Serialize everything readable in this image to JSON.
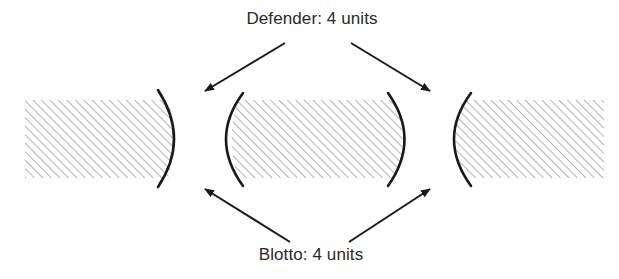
{
  "diagram": {
    "labels": {
      "defender": "Defender: 4 units",
      "blotto": "Blotto: 4 units"
    },
    "colors": {
      "background": "#ffffff",
      "ink": "#1a1a1a",
      "hatch": "#8a8a8a",
      "text": "#2a2a2a"
    },
    "regions": [
      {
        "name": "left-territory",
        "x": 25,
        "y": 100,
        "w": 150,
        "h": 78
      },
      {
        "name": "middle-territory",
        "x": 226,
        "y": 100,
        "w": 178,
        "h": 78
      },
      {
        "name": "right-territory",
        "x": 452,
        "y": 100,
        "w": 152,
        "h": 78
      }
    ],
    "fronts": [
      {
        "name": "front-1-left-edge",
        "side": "right"
      },
      {
        "name": "front-1-right-edge",
        "side": "left"
      },
      {
        "name": "front-2-left-edge",
        "side": "right"
      },
      {
        "name": "front-2-right-edge",
        "side": "left"
      }
    ],
    "arrows": [
      {
        "name": "defender-arrow-front-1",
        "from": [
          285,
          43
        ],
        "to": [
          205,
          91
        ]
      },
      {
        "name": "defender-arrow-front-2",
        "from": [
          351,
          43
        ],
        "to": [
          430,
          91
        ]
      },
      {
        "name": "blotto-arrow-front-1",
        "from": [
          290,
          242
        ],
        "to": [
          205,
          189
        ]
      },
      {
        "name": "blotto-arrow-front-2",
        "from": [
          349,
          242
        ],
        "to": [
          430,
          189
        ]
      }
    ]
  }
}
